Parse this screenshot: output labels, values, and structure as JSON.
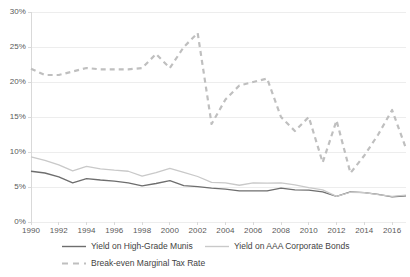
{
  "chart_data": {
    "type": "line",
    "title": "",
    "subtitle": "",
    "xlabel": "",
    "ylabel": "",
    "xlim": [
      1990,
      2017
    ],
    "ylim": [
      0,
      30
    ],
    "y_tick_format": "percent",
    "grid": true,
    "grid_axis": "y",
    "legend_position": "bottom",
    "x": [
      1990,
      1991,
      1992,
      1993,
      1994,
      1995,
      1996,
      1997,
      1998,
      1999,
      2000,
      2001,
      2002,
      2003,
      2004,
      2005,
      2006,
      2007,
      2008,
      2009,
      2010,
      2011,
      2012,
      2013,
      2014,
      2015,
      2016,
      2017
    ],
    "xticks": [
      "1990",
      "1992",
      "1994",
      "1996",
      "1998",
      "2000",
      "2002",
      "2004",
      "2006",
      "2008",
      "2010",
      "2012",
      "2014",
      "2016"
    ],
    "xtick_values": [
      1990,
      1992,
      1994,
      1996,
      1998,
      2000,
      2002,
      2004,
      2006,
      2008,
      2010,
      2012,
      2014,
      2016
    ],
    "yticks": [
      "0%",
      "5%",
      "10%",
      "15%",
      "20%",
      "25%",
      "30%"
    ],
    "ytick_values": [
      0,
      5,
      10,
      15,
      20,
      25,
      30
    ],
    "series": [
      {
        "name": "Yield on High-Grade Munis",
        "style": "solid",
        "color": "#6e6e6e",
        "width": 1.3,
        "values": [
          7.25,
          7.0,
          6.45,
          5.6,
          6.2,
          6.0,
          5.85,
          5.6,
          5.15,
          5.5,
          5.9,
          5.2,
          5.05,
          4.85,
          4.7,
          4.45,
          4.45,
          4.45,
          4.85,
          4.6,
          4.55,
          4.3,
          3.65,
          4.3,
          4.2,
          3.95,
          3.6,
          3.75
        ]
      },
      {
        "name": "Yield on AAA Corporate Bonds",
        "style": "solid",
        "color": "#c9c9c9",
        "width": 1.3,
        "values": [
          9.3,
          8.8,
          8.15,
          7.3,
          7.95,
          7.6,
          7.4,
          7.25,
          6.55,
          7.05,
          7.65,
          7.1,
          6.5,
          5.65,
          5.6,
          5.25,
          5.6,
          5.55,
          5.6,
          5.3,
          4.9,
          4.6,
          3.65,
          4.25,
          4.2,
          3.9,
          3.65,
          3.85
        ]
      },
      {
        "name": "Break-even Marginal Tax Rate",
        "style": "dashed",
        "color": "#bfbfbf",
        "width": 2.2,
        "dash": "5 4",
        "values": [
          21.9,
          21.0,
          21.0,
          21.5,
          22.0,
          21.8,
          21.8,
          21.8,
          22.0,
          24.0,
          22.0,
          25.0,
          27.0,
          14.0,
          17.5,
          19.5,
          20.0,
          20.5,
          15.0,
          13.0,
          15.0,
          8.5,
          14.5,
          7.0,
          9.5,
          12.5,
          16.0,
          10.5
        ]
      }
    ]
  },
  "axis": {
    "y_axis_color": "#d9d9d9",
    "grid_color": "#ededed",
    "tick_label_color": "#595959"
  },
  "legend": {
    "items": [
      {
        "label": "Yield on High-Grade Munis",
        "style": "solid",
        "color": "#6e6e6e"
      },
      {
        "label": "Yield on AAA Corporate Bonds",
        "style": "solid",
        "color": "#c9c9c9"
      },
      {
        "label": "Break-even Marginal Tax Rate",
        "style": "dashed",
        "color": "#bfbfbf"
      }
    ]
  }
}
